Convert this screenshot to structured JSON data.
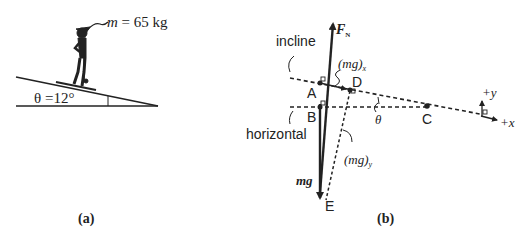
{
  "panel_a": {
    "caption": "(a)",
    "mass_label_var": "m",
    "mass_label_value": " = 65 kg",
    "angle_label": "θ =12°"
  },
  "panel_b": {
    "caption": "(b)",
    "normal_force_label": "F",
    "normal_force_subscript": "N",
    "incline_label": "incline",
    "horizontal_label": "horizontal",
    "mgx_label": "(mg)",
    "mgx_subscript": "x",
    "mgy_label": "(mg)",
    "mgy_subscript": "y",
    "weight_label": "mg",
    "theta_label": "θ",
    "points": {
      "A": "A",
      "B": "B",
      "C": "C",
      "D": "D",
      "E": "E"
    },
    "axes": {
      "x_label": "+x",
      "y_label": "+y"
    }
  }
}
